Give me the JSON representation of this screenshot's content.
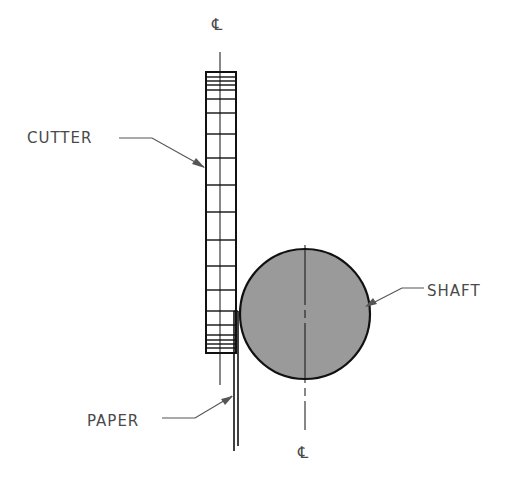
{
  "diagram": {
    "labels": {
      "cutter": "CUTTER",
      "shaft": "SHAFT",
      "paper": "PAPER"
    },
    "centerline_symbol": "CL",
    "centerline_top": "℄",
    "centerline_bottom": "℄",
    "colors": {
      "line": "#111111",
      "shaft_fill": "#9a9a9a",
      "label": "#4a4a4a",
      "leader": "#555555"
    }
  }
}
